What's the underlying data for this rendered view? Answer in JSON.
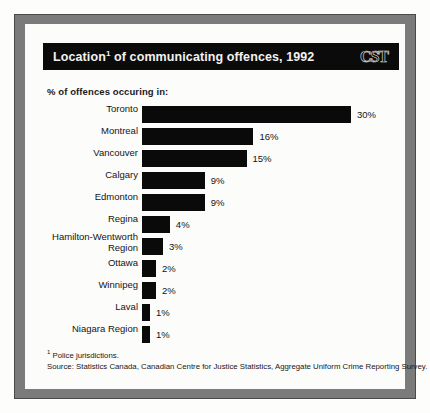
{
  "header": {
    "title_main": "Location",
    "title_footnote_marker": "1",
    "title_rest": " of communicating offences, 1992",
    "logo_text": "CST"
  },
  "chart_data": {
    "type": "bar",
    "orientation": "horizontal",
    "subtitle": "% of offences occuring in:",
    "xlabel": "",
    "ylabel": "",
    "xlim": [
      0,
      30
    ],
    "grid": false,
    "legend": "none",
    "categories": [
      "Toronto",
      "Montreal",
      "Vancouver",
      "Calgary",
      "Edmonton",
      "Regina",
      "Hamilton-Wentworth Region",
      "Ottawa",
      "Winnipeg",
      "Laval",
      "Niagara Region"
    ],
    "values": [
      30,
      16,
      15,
      9,
      9,
      4,
      3,
      2,
      2,
      1,
      1
    ],
    "value_labels": [
      "30%",
      "16%",
      "15%",
      "9%",
      "9%",
      "4%",
      "3%",
      "2%",
      "2%",
      "1%",
      "1%"
    ],
    "bar_color": "#0a0a0a"
  },
  "rows": [
    {
      "label": "Toronto",
      "value": 30,
      "value_label": "30%",
      "two_line": false
    },
    {
      "label": "Montreal",
      "value": 16,
      "value_label": "16%",
      "two_line": false
    },
    {
      "label": "Vancouver",
      "value": 15,
      "value_label": "15%",
      "two_line": false
    },
    {
      "label": "Calgary",
      "value": 9,
      "value_label": "9%",
      "two_line": false
    },
    {
      "label": "Edmonton",
      "value": 9,
      "value_label": "9%",
      "two_line": false
    },
    {
      "label": "Regina",
      "value": 4,
      "value_label": "4%",
      "two_line": false
    },
    {
      "label": "Hamilton-Wentworth\nRegion",
      "value": 3,
      "value_label": "3%",
      "two_line": true
    },
    {
      "label": "Ottawa",
      "value": 2,
      "value_label": "2%",
      "two_line": false
    },
    {
      "label": "Winnipeg",
      "value": 2,
      "value_label": "2%",
      "two_line": false
    },
    {
      "label": "Laval",
      "value": 1,
      "value_label": "1%",
      "two_line": false
    },
    {
      "label": "Niagara Region",
      "value": 1,
      "value_label": "1%",
      "two_line": false
    }
  ],
  "footnotes": {
    "marker": "1",
    "note": " Police jurisdictions.",
    "source": "Source: Statistics Canada, Canadian Centre for Justice Statistics, Aggregate Uniform Crime Reporting Survey."
  },
  "colors": {
    "bar": "#0a0a0a",
    "title_bar_background": "#0b0b0b",
    "title_text": "#f2f2f0",
    "frame": "#7b7b7b",
    "page_background": "#fdfdfc"
  }
}
